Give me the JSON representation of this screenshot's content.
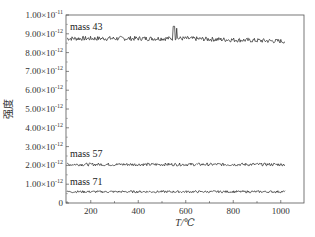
{
  "chart_data": {
    "type": "line",
    "title": "",
    "xlabel": "T/℃",
    "ylabel": "强度",
    "xlim": [
      100,
      1100
    ],
    "ylim": [
      0,
      1e-11
    ],
    "grid": false,
    "legend_position": "inline labels above each series",
    "x_ticks": [
      200,
      400,
      600,
      800,
      1000
    ],
    "y_ticks": [
      {
        "value": 0,
        "label": "0"
      },
      {
        "value": 1e-12,
        "mant": "1.00",
        "exp": "-12"
      },
      {
        "value": 2e-12,
        "mant": "2.00",
        "exp": "-12"
      },
      {
        "value": 3e-12,
        "mant": "3.00",
        "exp": "-12"
      },
      {
        "value": 4e-12,
        "mant": "4.00",
        "exp": "-12"
      },
      {
        "value": 5e-12,
        "mant": "5.00",
        "exp": "-12"
      },
      {
        "value": 6e-12,
        "mant": "6.00",
        "exp": "-12"
      },
      {
        "value": 7e-12,
        "mant": "7.00",
        "exp": "-12"
      },
      {
        "value": 8e-12,
        "mant": "8.00",
        "exp": "-12"
      },
      {
        "value": 9e-12,
        "mant": "9.00",
        "exp": "-12"
      },
      {
        "value": 1e-11,
        "mant": "1.00",
        "exp": "-11"
      }
    ],
    "series": [
      {
        "name": "mass 43",
        "x_range": [
          100,
          1020
        ],
        "baseline": 8.75e-12,
        "noise": 1.2e-13,
        "spike": {
          "x": 550,
          "value": 9.4e-12
        },
        "trend": "slight decrease toward 1000 ℃ (~8.6e-12)"
      },
      {
        "name": "mass 57",
        "x_range": [
          100,
          1020
        ],
        "baseline": 2.05e-12,
        "noise": 8e-14
      },
      {
        "name": "mass 71",
        "x_range": [
          100,
          1020
        ],
        "baseline": 6e-13,
        "noise": 6e-14
      }
    ]
  },
  "labels": {
    "x_axis": "T/℃",
    "y_axis": "强度",
    "times": "×10"
  }
}
